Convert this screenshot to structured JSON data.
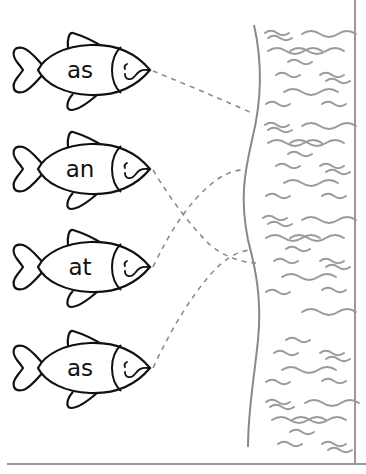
{
  "worksheet": {
    "fish": [
      {
        "label": "as",
        "cy": 70
      },
      {
        "label": "an",
        "cy": 169
      },
      {
        "label": "at",
        "cy": 267
      },
      {
        "label": "as",
        "cy": 368
      }
    ],
    "connections": [
      {
        "from_fish": 0,
        "to": [
          252,
          113
        ]
      },
      {
        "from_fish": 1,
        "to": [
          256,
          263
        ]
      },
      {
        "from_fish": 2,
        "to": [
          243,
          170
        ]
      },
      {
        "from_fish": 3,
        "to": [
          250,
          250
        ]
      }
    ],
    "colors": {
      "outline": "#111111",
      "water": "#9a9a9a",
      "dash": "#8c8c8c",
      "border": "#999999"
    }
  }
}
